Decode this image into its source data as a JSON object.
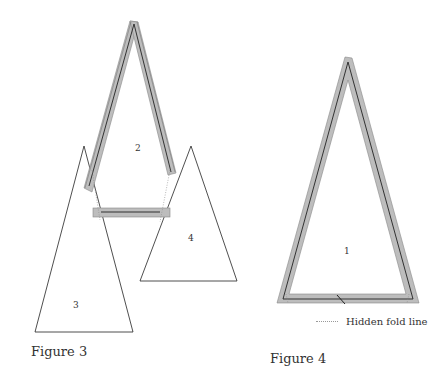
{
  "figures": [
    {
      "caption": "Figure 3",
      "pieces": [
        {
          "label": "2"
        },
        {
          "label": "3"
        },
        {
          "label": "4"
        }
      ]
    },
    {
      "caption": "Figure 4",
      "pieces": [
        {
          "label": "1"
        }
      ]
    }
  ],
  "legend": {
    "hidden_fold_line": "Hidden fold line"
  },
  "colors": {
    "strip_fill": "#bdbdbd",
    "strip_stroke": "#888888",
    "outline": "#222222"
  }
}
